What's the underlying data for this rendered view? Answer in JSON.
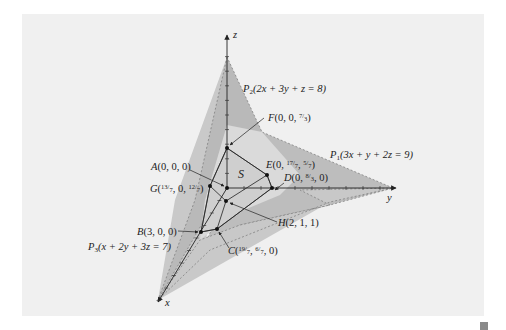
{
  "figure": {
    "axes": {
      "x": "x",
      "y": "y",
      "z": "z"
    },
    "region_label": "S",
    "planes": [
      {
        "id": "P1",
        "name": "P",
        "sub": "1",
        "equation": "(3x + y + 2z = 9)"
      },
      {
        "id": "P2",
        "name": "P",
        "sub": "2",
        "equation": "(2x + 3y + z = 8)"
      },
      {
        "id": "P3",
        "name": "P",
        "sub": "3",
        "equation": "(x + 2y + 3z = 7)"
      }
    ],
    "points": {
      "A": {
        "name": "A",
        "coords": "(0, 0, 0)"
      },
      "B": {
        "name": "B",
        "coords": "(3, 0, 0)"
      },
      "C": {
        "name": "C",
        "pre": "(",
        "n1": "19",
        "d1": "7",
        "mid": ", ",
        "n2": "6",
        "d2": "7",
        "post": ", 0)"
      },
      "D": {
        "name": "D",
        "pre": "(0, ",
        "n1": "8",
        "d1": "3",
        "post": ", 0)"
      },
      "E": {
        "name": "E",
        "pre": "(0, ",
        "n1": "17",
        "d1": "7",
        "mid": ", ",
        "n2": "5",
        "d2": "7",
        "post": ")"
      },
      "F": {
        "name": "F",
        "pre": "(0, 0, ",
        "n1": "7",
        "d1": "3",
        "post": ")"
      },
      "G": {
        "name": "G",
        "pre": "(",
        "n1": "13",
        "d1": "7",
        "mid": ", 0, ",
        "n2": "12",
        "d2": "7",
        "post": ")"
      },
      "H": {
        "name": "H",
        "coords": "(2, 1, 1)"
      }
    },
    "colors": {
      "panel": "#f0f0f0",
      "plane_dark": "#b8b8b8",
      "plane_mid": "#c9c9c9",
      "plane_light": "#dcdcdc",
      "region": "#d2d2d2",
      "ink": "#222222"
    }
  }
}
